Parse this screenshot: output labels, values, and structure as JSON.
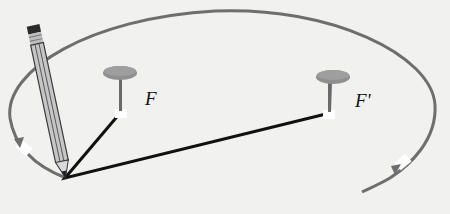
{
  "diagram": {
    "foci": [
      {
        "label": "F",
        "x": 121,
        "y": 112
      },
      {
        "label": "F'",
        "x": 330,
        "y": 113
      }
    ],
    "pencil_tip": {
      "x": 65,
      "y": 178
    },
    "colors": {
      "ellipse": "#6e6e6e",
      "string": "#111111",
      "pin_head": "#8f8f8f",
      "background": "#f1f1f0"
    }
  }
}
